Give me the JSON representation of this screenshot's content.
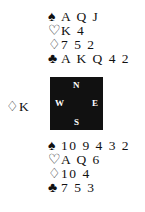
{
  "north": {
    "spades": {
      "symbol": "♠",
      "cards": "A Q J"
    },
    "hearts": {
      "symbol": "♡",
      "cards": "K 4"
    },
    "diamonds": {
      "symbol": "♢",
      "cards": "7 5 2"
    },
    "clubs": {
      "symbol": "♣",
      "cards": "A K Q 4 2"
    }
  },
  "west": {
    "played": {
      "symbol": "♢",
      "cards": "K"
    }
  },
  "compass": {
    "n": "N",
    "s": "S",
    "w": "W",
    "e": "E"
  },
  "south": {
    "spades": {
      "symbol": "♠",
      "cards": "10 9 4 3 2"
    },
    "hearts": {
      "symbol": "♡",
      "cards": "A Q 6"
    },
    "diamonds": {
      "symbol": "♢",
      "cards": "10 4"
    },
    "clubs": {
      "symbol": "♣",
      "cards": "7 5 3"
    }
  }
}
